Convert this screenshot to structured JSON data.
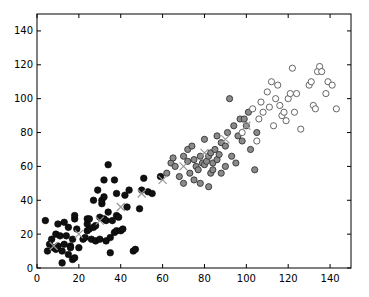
{
  "chart_data": {
    "type": "scatter",
    "title": "",
    "xlabel": "",
    "ylabel": "",
    "xlim": [
      0,
      150
    ],
    "ylim": [
      0,
      150
    ],
    "grid": false,
    "legend": null,
    "xticks": [
      0,
      20,
      40,
      60,
      80,
      100,
      120,
      140
    ],
    "yticks": [
      0,
      20,
      40,
      60,
      80,
      100,
      120,
      140
    ],
    "series": [
      {
        "name": "cluster-1",
        "marker": "filled-circle",
        "color": "#111111",
        "points": [
          [
            4,
            28
          ],
          [
            5,
            10
          ],
          [
            6,
            14
          ],
          [
            7,
            17
          ],
          [
            8,
            12
          ],
          [
            9,
            11
          ],
          [
            9,
            20
          ],
          [
            10,
            13
          ],
          [
            10,
            26
          ],
          [
            11,
            19
          ],
          [
            12,
            3
          ],
          [
            12,
            10
          ],
          [
            13,
            27
          ],
          [
            13,
            14
          ],
          [
            14,
            19
          ],
          [
            15,
            8
          ],
          [
            15,
            24
          ],
          [
            16,
            13
          ],
          [
            16,
            12
          ],
          [
            17,
            17
          ],
          [
            17,
            5
          ],
          [
            18,
            6
          ],
          [
            18,
            29
          ],
          [
            18,
            31
          ],
          [
            19,
            23
          ],
          [
            20,
            12
          ],
          [
            22,
            17
          ],
          [
            23,
            18
          ],
          [
            24,
            26
          ],
          [
            24,
            29
          ],
          [
            24,
            22
          ],
          [
            25,
            29
          ],
          [
            25,
            23
          ],
          [
            26,
            17
          ],
          [
            27,
            24
          ],
          [
            27,
            40
          ],
          [
            28,
            16
          ],
          [
            28,
            25
          ],
          [
            29,
            46
          ],
          [
            30,
            30
          ],
          [
            30,
            17
          ],
          [
            31,
            38
          ],
          [
            31,
            40
          ],
          [
            32,
            42
          ],
          [
            32,
            29
          ],
          [
            32,
            52
          ],
          [
            33,
            16
          ],
          [
            33,
            28
          ],
          [
            34,
            61
          ],
          [
            34,
            33
          ],
          [
            35,
            18
          ],
          [
            35,
            9
          ],
          [
            36,
            28
          ],
          [
            37,
            21
          ],
          [
            37,
            52
          ],
          [
            38,
            22
          ],
          [
            38,
            31
          ],
          [
            38,
            44
          ],
          [
            39,
            30
          ],
          [
            40,
            22
          ],
          [
            41,
            23
          ],
          [
            42,
            43
          ],
          [
            43,
            36
          ],
          [
            44,
            46
          ],
          [
            46,
            10
          ],
          [
            47,
            11
          ],
          [
            49,
            35
          ],
          [
            50,
            46
          ],
          [
            51,
            53
          ],
          [
            53,
            45
          ],
          [
            55,
            44
          ],
          [
            59,
            54
          ]
        ]
      },
      {
        "name": "cluster-2",
        "marker": "grey-circle",
        "color": "#6a6a6a",
        "points": [
          [
            62,
            56
          ],
          [
            64,
            62
          ],
          [
            65,
            65
          ],
          [
            66,
            60
          ],
          [
            68,
            54
          ],
          [
            70,
            50
          ],
          [
            70,
            66
          ],
          [
            72,
            70
          ],
          [
            72,
            63
          ],
          [
            73,
            56
          ],
          [
            74,
            72
          ],
          [
            75,
            64
          ],
          [
            75,
            52
          ],
          [
            76,
            60
          ],
          [
            77,
            58
          ],
          [
            78,
            66
          ],
          [
            78,
            50
          ],
          [
            79,
            62
          ],
          [
            80,
            76
          ],
          [
            80,
            61
          ],
          [
            81,
            63
          ],
          [
            82,
            66
          ],
          [
            82,
            48
          ],
          [
            83,
            68
          ],
          [
            83,
            56
          ],
          [
            84,
            58
          ],
          [
            84,
            62
          ],
          [
            85,
            70
          ],
          [
            86,
            78
          ],
          [
            86,
            64
          ],
          [
            87,
            67
          ],
          [
            88,
            74
          ],
          [
            88,
            56
          ],
          [
            90,
            72
          ],
          [
            90,
            60
          ],
          [
            91,
            80
          ],
          [
            92,
            100
          ],
          [
            93,
            66
          ],
          [
            94,
            84
          ],
          [
            95,
            62
          ],
          [
            96,
            78
          ],
          [
            97,
            88
          ],
          [
            98,
            75
          ],
          [
            99,
            88
          ],
          [
            100,
            84
          ],
          [
            101,
            92
          ],
          [
            102,
            70
          ],
          [
            104,
            58
          ],
          [
            105,
            80
          ]
        ]
      },
      {
        "name": "cluster-3",
        "marker": "open-circle",
        "color": "#555555",
        "points": [
          [
            98,
            80
          ],
          [
            103,
            94
          ],
          [
            105,
            75
          ],
          [
            106,
            88
          ],
          [
            107,
            98
          ],
          [
            108,
            92
          ],
          [
            110,
            104
          ],
          [
            111,
            95
          ],
          [
            112,
            110
          ],
          [
            113,
            84
          ],
          [
            114,
            100
          ],
          [
            115,
            108
          ],
          [
            116,
            96
          ],
          [
            117,
            90
          ],
          [
            118,
            92
          ],
          [
            119,
            87
          ],
          [
            120,
            100
          ],
          [
            121,
            103
          ],
          [
            122,
            118
          ],
          [
            123,
            92
          ],
          [
            124,
            103
          ],
          [
            126,
            82
          ],
          [
            130,
            108
          ],
          [
            131,
            110
          ],
          [
            132,
            96
          ],
          [
            133,
            94
          ],
          [
            134,
            116
          ],
          [
            135,
            119
          ],
          [
            136,
            116
          ],
          [
            138,
            103
          ],
          [
            139,
            110
          ],
          [
            141,
            108
          ],
          [
            143,
            94
          ]
        ]
      },
      {
        "name": "trajectory",
        "marker": "x",
        "color": "#999999",
        "points": [
          [
            8,
            13
          ],
          [
            20,
            20
          ],
          [
            30,
            28
          ],
          [
            40,
            36
          ],
          [
            50,
            44
          ],
          [
            60,
            52
          ],
          [
            70,
            60
          ],
          [
            80,
            68
          ],
          [
            90,
            76
          ],
          [
            100,
            84
          ]
        ]
      }
    ]
  }
}
